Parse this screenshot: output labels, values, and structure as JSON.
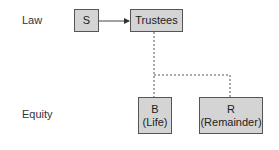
{
  "diagram": {
    "rows": {
      "law": "Law",
      "equity": "Equity"
    },
    "nodes": {
      "settlor": {
        "label": "S"
      },
      "trustees": {
        "label": "Trustees"
      },
      "beneficiary_life": {
        "line1": "B",
        "line2": "(Life)"
      },
      "remainder": {
        "line1": "R",
        "line2": "(Remainder)"
      }
    },
    "edges": [
      {
        "from": "S",
        "to": "Trustees",
        "style": "solid-arrow"
      },
      {
        "from": "Trustees",
        "to": "B (Life)",
        "style": "dashed"
      },
      {
        "from": "Trustees",
        "to": "R (Remainder)",
        "style": "dashed"
      }
    ],
    "colors": {
      "box_fill": "#d4d4d4",
      "box_border": "#555555",
      "line": "#444444"
    }
  }
}
